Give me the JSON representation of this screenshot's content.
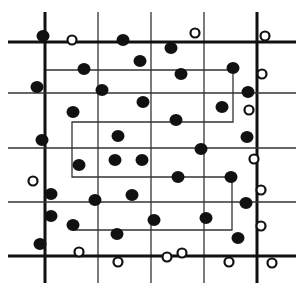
{
  "diagram": {
    "width": 304,
    "height": 293,
    "colors": {
      "background": "#ffffff",
      "ink": "#111111",
      "grid": "#333333"
    },
    "grid": {
      "extent": {
        "x1": 8,
        "x2": 296,
        "y1": 12,
        "y2": 283
      },
      "vertical": [
        {
          "x": 45,
          "thick": true
        },
        {
          "x": 98,
          "thick": false
        },
        {
          "x": 151,
          "thick": false
        },
        {
          "x": 204,
          "thick": false
        },
        {
          "x": 257,
          "thick": true
        }
      ],
      "horizontal": [
        {
          "y": 42,
          "thick": true
        },
        {
          "y": 93,
          "thick": false
        },
        {
          "y": 148,
          "thick": false
        },
        {
          "y": 202,
          "thick": false
        },
        {
          "y": 256,
          "thick": true
        }
      ]
    },
    "path": {
      "points": [
        [
          46,
          70
        ],
        [
          233,
          70
        ],
        [
          233,
          122
        ],
        [
          72,
          122
        ],
        [
          72,
          177
        ],
        [
          232,
          177
        ],
        [
          232,
          230
        ],
        [
          73,
          230
        ]
      ]
    },
    "filled_dots": [
      [
        43,
        36
      ],
      [
        123,
        40
      ],
      [
        171,
        48
      ],
      [
        84,
        69
      ],
      [
        140,
        61
      ],
      [
        181,
        74
      ],
      [
        233,
        68
      ],
      [
        37,
        87
      ],
      [
        102,
        90
      ],
      [
        248,
        92
      ],
      [
        143,
        102
      ],
      [
        73,
        112
      ],
      [
        222,
        107
      ],
      [
        176,
        120
      ],
      [
        118,
        136
      ],
      [
        42,
        140
      ],
      [
        247,
        137
      ],
      [
        201,
        149
      ],
      [
        79,
        165
      ],
      [
        115,
        160
      ],
      [
        142,
        160
      ],
      [
        231,
        177
      ],
      [
        178,
        177
      ],
      [
        51,
        194
      ],
      [
        95,
        200
      ],
      [
        132,
        195
      ],
      [
        246,
        203
      ],
      [
        51,
        216
      ],
      [
        73,
        225
      ],
      [
        154,
        220
      ],
      [
        206,
        218
      ],
      [
        238,
        238
      ],
      [
        117,
        234
      ],
      [
        40,
        244
      ]
    ],
    "open_circles": [
      [
        72,
        40
      ],
      [
        195,
        33
      ],
      [
        265,
        36
      ],
      [
        262,
        74
      ],
      [
        249,
        110
      ],
      [
        254,
        159
      ],
      [
        33,
        181
      ],
      [
        261,
        190
      ],
      [
        261,
        226
      ],
      [
        79,
        252
      ],
      [
        118,
        262
      ],
      [
        167,
        257
      ],
      [
        182,
        253
      ],
      [
        229,
        262
      ],
      [
        272,
        263
      ]
    ]
  }
}
